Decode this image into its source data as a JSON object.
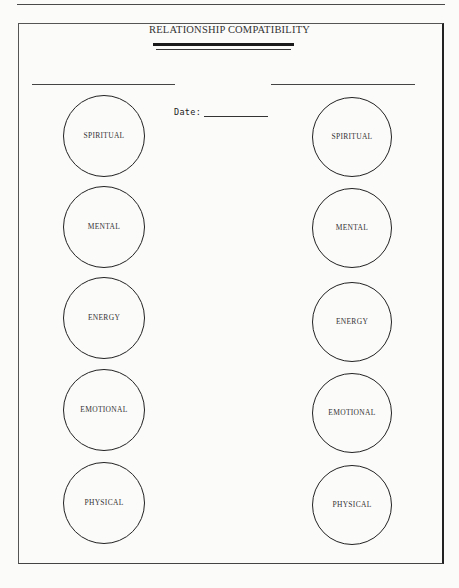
{
  "form": {
    "title": "RELATIONSHIP COMPATIBILITY",
    "date_label": "Date:",
    "date_value": "",
    "person_a_name": "",
    "person_b_name": ""
  },
  "person_a": {
    "circles": [
      {
        "label": "SPIRITUAL"
      },
      {
        "label": "MENTAL"
      },
      {
        "label": "ENERGY"
      },
      {
        "label": "EMOTIONAL"
      },
      {
        "label": "PHYSICAL"
      }
    ]
  },
  "person_b": {
    "circles": [
      {
        "label": "SPIRITUAL"
      },
      {
        "label": "MENTAL"
      },
      {
        "label": "ENERGY"
      },
      {
        "label": "EMOTIONAL"
      },
      {
        "label": "PHYSICAL"
      }
    ]
  }
}
